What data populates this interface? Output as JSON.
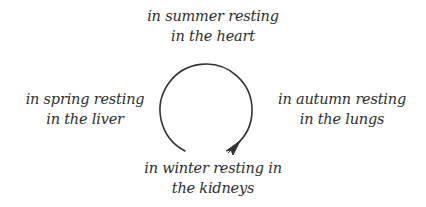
{
  "diagram": {
    "type": "cycle",
    "direction": "clockwise",
    "colors": {
      "text": "#2e2e2e",
      "stroke": "#333333",
      "background": "#ffffff"
    },
    "nodes": {
      "top": {
        "line1": "in summer resting",
        "line2": "in the heart"
      },
      "left": {
        "line1": "in spring resting",
        "line2": "in the liver"
      },
      "right": {
        "line1": "in autumn resting",
        "line2": "in the lungs"
      },
      "bottom": {
        "line1": "in winter resting in",
        "line2": "the kidneys"
      }
    },
    "arrow": {
      "icon": "circular-arrow-icon"
    }
  }
}
